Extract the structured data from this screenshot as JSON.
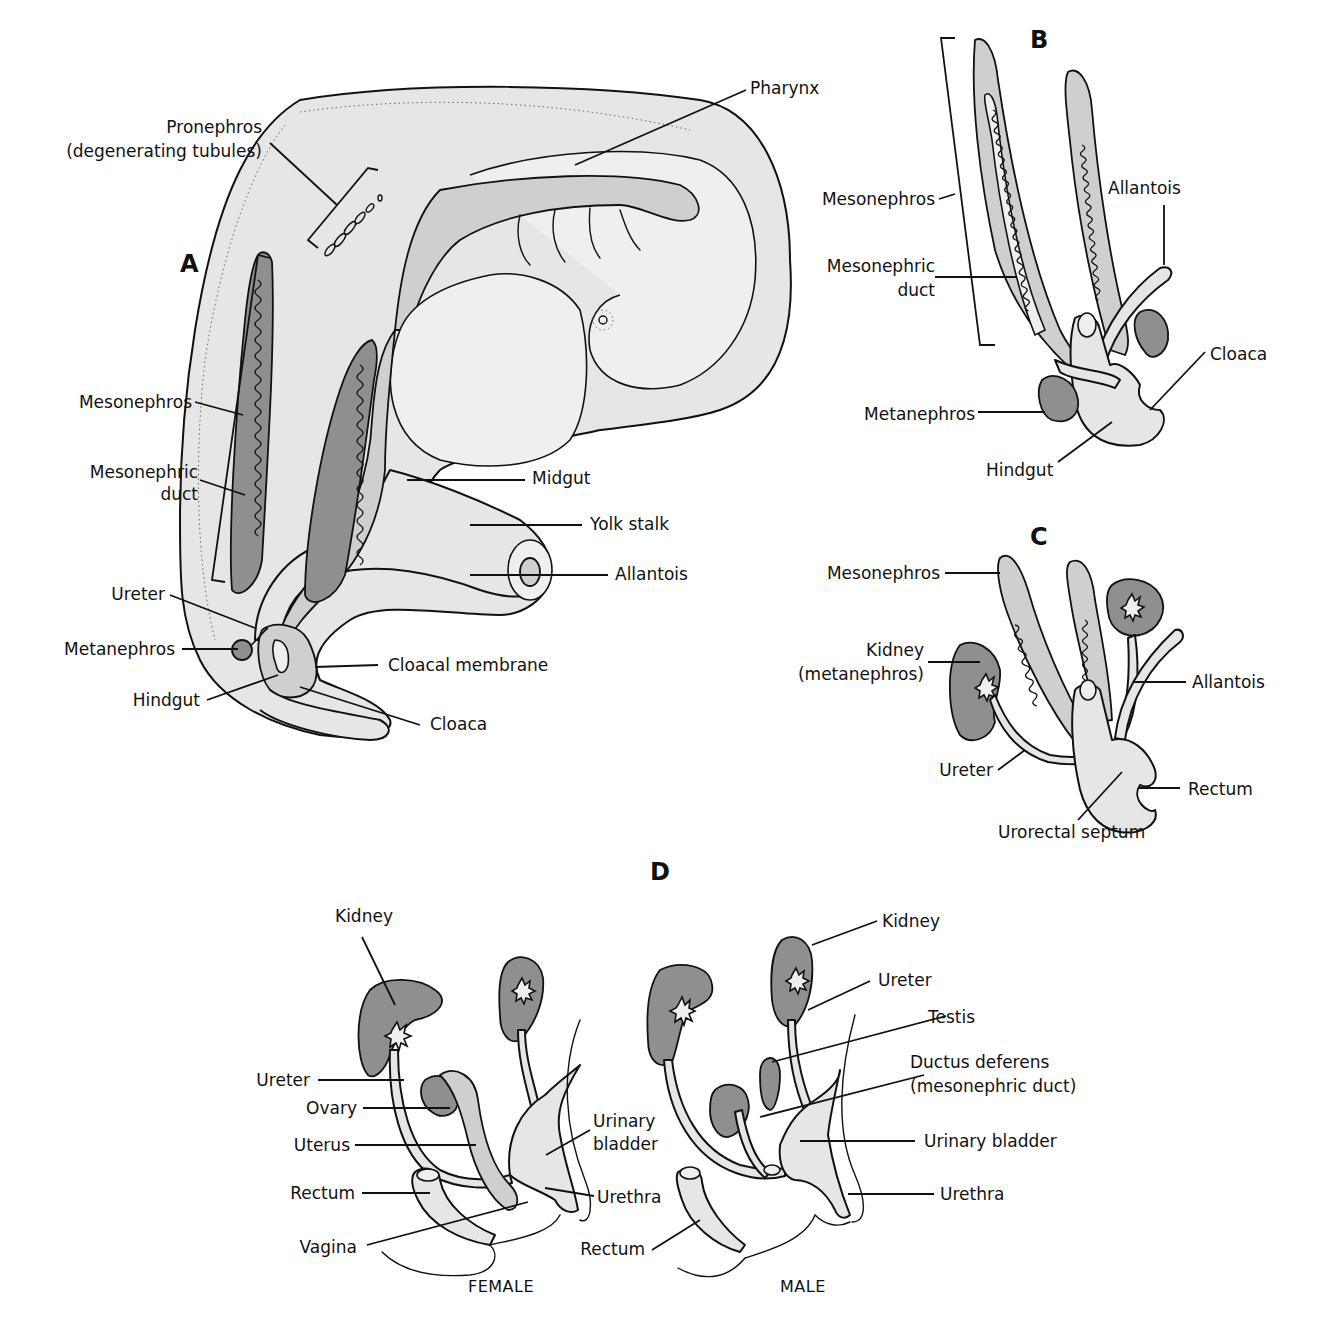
{
  "figure": {
    "panels": [
      {
        "id": "A",
        "labels": [
          {
            "text_line1": "Pronephros",
            "text_line2": "(degenerating tubules)"
          },
          {
            "text": "Pharynx"
          },
          {
            "text": "Mesonephros"
          },
          {
            "text_line1": "Mesonephric",
            "text_line2": "duct"
          },
          {
            "text": "Midgut"
          },
          {
            "text": "Yolk stalk"
          },
          {
            "text": "Allantois"
          },
          {
            "text": "Ureter"
          },
          {
            "text": "Metanephros"
          },
          {
            "text": "Cloacal membrane"
          },
          {
            "text": "Hindgut"
          },
          {
            "text": "Cloaca"
          }
        ]
      },
      {
        "id": "B",
        "labels": [
          {
            "text": "Mesonephros"
          },
          {
            "text_line1": "Mesonephric",
            "text_line2": "duct"
          },
          {
            "text": "Allantois"
          },
          {
            "text": "Cloaca"
          },
          {
            "text": "Metanephros"
          },
          {
            "text": "Hindgut"
          }
        ]
      },
      {
        "id": "C",
        "labels": [
          {
            "text": "Mesonephros"
          },
          {
            "text_line1": "Kidney",
            "text_line2": "(metanephros)"
          },
          {
            "text": "Allantois"
          },
          {
            "text": "Ureter"
          },
          {
            "text": "Rectum"
          },
          {
            "text": "Urorectal septum"
          }
        ]
      },
      {
        "id": "D",
        "female": {
          "caption": "FEMALE",
          "labels": [
            {
              "text": "Kidney"
            },
            {
              "text": "Ureter"
            },
            {
              "text": "Ovary"
            },
            {
              "text": "Uterus"
            },
            {
              "text": "Rectum"
            },
            {
              "text": "Vagina"
            },
            {
              "text_line1": "Urinary",
              "text_line2": "bladder"
            },
            {
              "text": "Urethra"
            }
          ]
        },
        "male": {
          "caption": "MALE",
          "labels": [
            {
              "text": "Kidney"
            },
            {
              "text": "Ureter"
            },
            {
              "text": "Testis"
            },
            {
              "text_line1": "Ductus deferens",
              "text_line2": "(mesonephric duct)"
            },
            {
              "text": "Urinary bladder"
            },
            {
              "text": "Urethra"
            },
            {
              "text": "Rectum"
            }
          ]
        }
      }
    ],
    "colors": {
      "outline": "#111111",
      "light_tissue": "#e6e6e6",
      "medium_tissue": "#cfcfcf",
      "dark_tissue": "#8f8f8f",
      "background": "#ffffff"
    }
  }
}
